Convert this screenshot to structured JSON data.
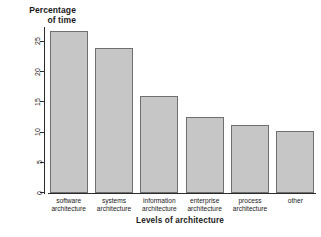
{
  "chart_data": {
    "type": "bar",
    "title": "",
    "xlabel": "Levels of architecture",
    "ylabel": "Percentage of time",
    "ylabel_lines": [
      "Percentage",
      "of time"
    ],
    "categories": [
      "software architecture",
      "systems architecture",
      "information architecture",
      "enterprise architecture",
      "process architecture",
      "other"
    ],
    "category_lines": [
      [
        "software",
        "architecture"
      ],
      [
        "systems",
        "architecture"
      ],
      [
        "information",
        "architecture"
      ],
      [
        "enterprise",
        "architecture"
      ],
      [
        "process",
        "architecture"
      ],
      [
        "other",
        ""
      ]
    ],
    "values": [
      26.8,
      24.0,
      16.0,
      12.6,
      11.3,
      10.2
    ],
    "ylim": [
      0,
      27.6
    ],
    "yticks": [
      0,
      5,
      10,
      15,
      20,
      25
    ],
    "ytick_labels": [
      "0",
      "5",
      "10",
      "15",
      "20",
      "25"
    ],
    "grid": false,
    "legend": "none",
    "bar_fill": "#c6c6c6",
    "bar_border": "#6f6f6f",
    "axis_color": "#2b2b2b"
  }
}
